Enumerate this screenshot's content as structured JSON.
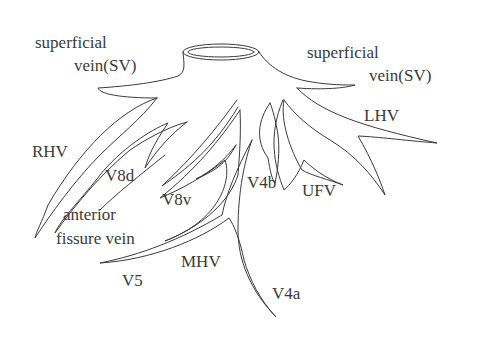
{
  "diagram": {
    "line_color": "#3a3a3a",
    "background": "#ffffff",
    "labels": {
      "sv_left_1": "superficial",
      "sv_left_2": "vein(SV)",
      "sv_right_1": "superficial",
      "sv_right_2": "vein(SV)",
      "rhv": "RHV",
      "lhv": "LHV",
      "v8d": "V8d",
      "v8v": "V8v",
      "v4b": "V4b",
      "ufv": "UFV",
      "afv_1": "anterior",
      "afv_2": "fissure vein",
      "mhv": "MHV",
      "v5": "V5",
      "v4a": "V4a"
    }
  }
}
